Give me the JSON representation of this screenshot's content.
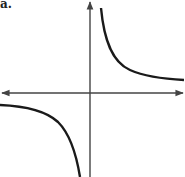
{
  "label": "a.",
  "figure": {
    "type": "graph of hyperbola y = k/x",
    "axes": {
      "x_axis": {
        "arrows": "both",
        "y_px": 93
      },
      "y_axis": {
        "arrows": "up",
        "x_px": 90
      }
    },
    "branches": [
      {
        "quadrant": "I",
        "description": "decreasing curve approaching x-axis and y-axis"
      },
      {
        "quadrant": "III",
        "description": "decreasing curve approaching x-axis and y-axis"
      }
    ],
    "colors": {
      "axis": "#444444",
      "curve": "#1a1a1a"
    }
  }
}
